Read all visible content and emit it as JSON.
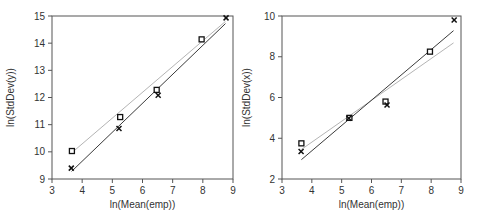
{
  "chart_data": [
    {
      "type": "scatter",
      "title": "",
      "xlabel": "ln(Mean(emp))",
      "ylabel": "ln(StdDev(y))",
      "xlim": [
        3,
        9
      ],
      "ylim": [
        9,
        15
      ],
      "xticks": [
        "3",
        "4",
        "5",
        "6",
        "7",
        "8",
        "9"
      ],
      "yticks": [
        "9",
        "10",
        "11",
        "12",
        "13",
        "14",
        "15"
      ],
      "grid": false,
      "legend": null,
      "series": [
        {
          "name": "square-markers",
          "marker": "square",
          "x": [
            3.66,
            5.26,
            6.47,
            7.96
          ],
          "y": [
            10.03,
            11.28,
            12.28,
            14.14
          ]
        },
        {
          "name": "x-markers",
          "marker": "x",
          "x": [
            3.64,
            5.22,
            6.52,
            8.77
          ],
          "y": [
            9.4,
            10.86,
            12.08,
            14.93
          ]
        }
      ],
      "fit_lines": [
        {
          "name": "square-fit",
          "color": "#b4b4b4",
          "x": [
            3.65,
            8.75
          ],
          "y": [
            9.96,
            14.8
          ]
        },
        {
          "name": "x-fit",
          "color": "#3a3a3a",
          "x": [
            3.65,
            8.75
          ],
          "y": [
            9.28,
            14.72
          ]
        }
      ]
    },
    {
      "type": "scatter",
      "title": "",
      "xlabel": "ln(Mean(emp))",
      "ylabel": "ln(StdDev(x))",
      "xlim": [
        3,
        9
      ],
      "ylim": [
        2,
        10
      ],
      "xticks": [
        "3",
        "4",
        "5",
        "6",
        "7",
        "8",
        "9"
      ],
      "yticks": [
        "2",
        "4",
        "6",
        "8",
        "10"
      ],
      "grid": false,
      "legend": null,
      "series": [
        {
          "name": "square-markers",
          "marker": "square",
          "x": [
            3.65,
            5.26,
            6.47,
            7.96
          ],
          "y": [
            3.75,
            5.0,
            5.8,
            8.25
          ]
        },
        {
          "name": "x-markers",
          "marker": "x",
          "x": [
            3.64,
            5.24,
            6.52,
            8.77
          ],
          "y": [
            3.35,
            4.98,
            5.63,
            9.8
          ]
        }
      ],
      "fit_lines": [
        {
          "name": "square-fit",
          "color": "#b4b4b4",
          "x": [
            3.65,
            8.75
          ],
          "y": [
            3.45,
            8.68
          ]
        },
        {
          "name": "x-fit",
          "color": "#3a3a3a",
          "x": [
            3.65,
            8.75
          ],
          "y": [
            2.95,
            9.28
          ]
        }
      ]
    }
  ]
}
